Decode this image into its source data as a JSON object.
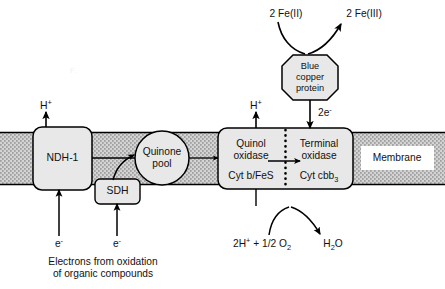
{
  "figure": {
    "type": "biochemical-pathway-diagram",
    "background_color": "#ffffff",
    "line_color": "#000000",
    "complex_fill_color": "#e8e8e8",
    "membrane_fill_color": "#c9c9c9"
  },
  "membrane": {
    "label": "Membrane",
    "band_top_y": 132,
    "band_bottom_y": 185
  },
  "complexes": [
    {
      "id": "ndh1",
      "label": "NDH-1",
      "shape": "rounded-rect",
      "x": 33,
      "y": 127,
      "w": 59,
      "h": 63
    },
    {
      "id": "sdh",
      "label": "SDH",
      "shape": "rounded-rect",
      "x": 95,
      "y": 179,
      "w": 45,
      "h": 25
    },
    {
      "id": "quinone-pool",
      "label_line1": "Quinone",
      "label_line2": "pool",
      "shape": "circle",
      "cx": 162,
      "cy": 158,
      "r": 27
    },
    {
      "id": "oxidase-complex",
      "shape": "rounded-rect",
      "x": 218,
      "y": 128,
      "w": 135,
      "h": 61,
      "divider_style": "dotted-vertical",
      "left_panel": {
        "title_line1": "Quinol",
        "title_line2": "oxidase",
        "subtitle": "Cyt b/FeS"
      },
      "right_panel": {
        "title_line1": "Terminal",
        "title_line2": "oxidase",
        "subtitle_prefix": "Cyt cbb",
        "subtitle_sub": "3"
      }
    },
    {
      "id": "blue-copper-protein",
      "label_line1": "Blue",
      "label_line2": "copper",
      "label_line3": "protein",
      "shape": "octagon",
      "cx": 310,
      "cy": 75,
      "w": 56,
      "h": 56
    }
  ],
  "labels": {
    "proton_left": "H",
    "proton_left_charge": "+",
    "proton_right": "H",
    "proton_right_charge": "+",
    "two_electrons": "2e",
    "two_electrons_charge": "-",
    "fe_two": "2 Fe(II)",
    "fe_three": "2 Fe(III)",
    "electron_left": "e",
    "electron_left_charge": "-",
    "electron_right": "e",
    "electron_right_charge": "-",
    "caption_line1": "Electrons from oxidation",
    "caption_line2": "of organic compounds",
    "substrate_prefix": "2H",
    "substrate_charge": "+",
    "substrate_suffix": " + 1/2 O",
    "substrate_sub": "2",
    "product_prefix": "H",
    "product_sub": "2",
    "product_suffix": "O"
  }
}
